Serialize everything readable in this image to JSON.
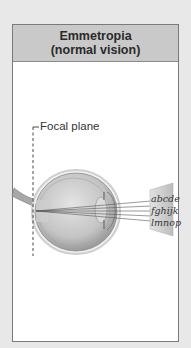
{
  "panel": {
    "title_line1": "Emmetropia",
    "title_line2": "(normal vision)"
  },
  "diagram": {
    "focal_plane_label": "Focal plane",
    "eye_chart": {
      "lines": [
        "abcde",
        "fghijk",
        "lmnop"
      ]
    },
    "colors": {
      "background": "#e8e8e8",
      "header": "#c9c9c9",
      "panel": "#ffffff",
      "eye_shading": "#bdbdbd",
      "chart_card": "#d6d6d6",
      "rays": "#555555"
    }
  }
}
